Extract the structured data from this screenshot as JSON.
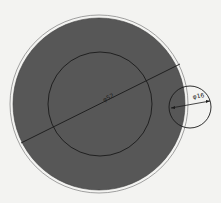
{
  "diagram": {
    "type": "technical-drawing",
    "colors": {
      "background": "#f3f3f1",
      "fill": "#575757",
      "line": "#1a1a1a",
      "outer_ring": "#8a8a8a"
    },
    "outer_ring": {
      "cx": 99,
      "cy": 104,
      "r": 89
    },
    "filled_disc": {
      "cx": 99,
      "cy": 104,
      "r": 86
    },
    "inner_circle": {
      "cx": 100,
      "cy": 104,
      "r": 52
    },
    "small_circle": {
      "cx": 190,
      "cy": 107,
      "r": 21
    },
    "dimensions": {
      "large": {
        "label": "φ52",
        "x1": 21,
        "y1": 143,
        "x2": 180,
        "y2": 64
      },
      "small": {
        "label": "φ16",
        "x1": 171,
        "y1": 108,
        "x2": 210,
        "y2": 101
      }
    }
  }
}
